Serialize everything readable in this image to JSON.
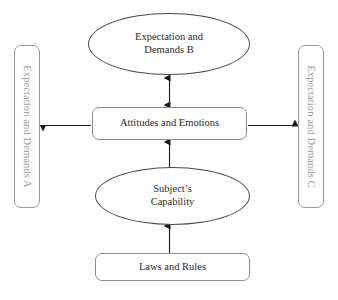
{
  "diagram": {
    "background_color": "#ffffff",
    "nodes": {
      "expectation_a": {
        "label": "Expectation and Demands A",
        "shape": "rounded-rectangle",
        "orientation": "vertical",
        "text_color": "#9d9d9d",
        "border_color": "#9a9a9a"
      },
      "expectation_b": {
        "line1": "Expectation and",
        "line2": "Demands B",
        "shape": "ellipse",
        "text_color": "#2b2b2b",
        "border_color": "#4a4a4a"
      },
      "expectation_c": {
        "label": "Expectation and Demands C",
        "shape": "rounded-rectangle",
        "orientation": "vertical",
        "text_color": "#9d9d9d",
        "border_color": "#9a9a9a"
      },
      "attitudes": {
        "label": "Attitudes and Emotions",
        "shape": "rounded-rectangle",
        "text_color": "#2b2b2b",
        "border_color": "#8d8d8d"
      },
      "capability": {
        "line1": "Subject’s",
        "line2": "Capability",
        "shape": "ellipse",
        "text_color": "#2b2b2b",
        "border_color": "#4a4a4a"
      },
      "laws": {
        "label": "Laws and Rules",
        "shape": "rounded-rectangle",
        "text_color": "#2b2b2b",
        "border_color": "#8d8d8d"
      }
    },
    "connectors": [
      {
        "name": "attitudes-to-expectation-b",
        "from": "attitudes",
        "to": "expectation_b",
        "direction": "bidirectional",
        "style": "solid",
        "color": "#1a1a1a"
      },
      {
        "name": "capability-to-attitudes",
        "from": "capability",
        "to": "attitudes",
        "direction": "up",
        "style": "solid",
        "color": "#1a1a1a"
      },
      {
        "name": "laws-to-capability",
        "from": "laws",
        "to": "capability",
        "direction": "up",
        "style": "solid",
        "color": "#1a1a1a"
      },
      {
        "name": "attitudes-to-expectation-a",
        "from": "attitudes",
        "to": "expectation_a",
        "direction": "left",
        "style": "solid",
        "color": "#1a1a1a"
      },
      {
        "name": "attitudes-to-expectation-c",
        "from": "attitudes",
        "to": "expectation_c",
        "direction": "right",
        "style": "solid",
        "color": "#1a1a1a"
      }
    ]
  }
}
